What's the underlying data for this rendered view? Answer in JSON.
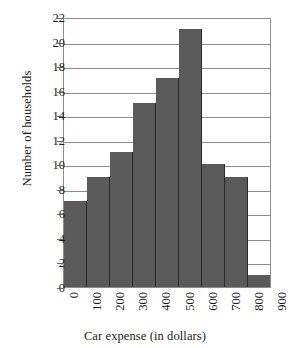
{
  "chart_data": {
    "type": "bar",
    "title": "",
    "subtitle": "",
    "xlabel": "Car expense (in dollars)",
    "ylabel": "Number of households",
    "categories": [
      "0-100",
      "100-200",
      "200-300",
      "300-400",
      "400-500",
      "500-600",
      "600-700",
      "700-800",
      "800-900"
    ],
    "bin_edges": [
      0,
      100,
      200,
      300,
      400,
      500,
      600,
      700,
      800,
      900
    ],
    "values": [
      7,
      9,
      11,
      15,
      17,
      21,
      10,
      9,
      1
    ],
    "xlim": [
      0,
      900
    ],
    "ylim": [
      0,
      22
    ],
    "y_ticks": [
      0,
      2,
      4,
      6,
      8,
      10,
      12,
      14,
      16,
      18,
      20,
      22
    ],
    "x_ticks": [
      0,
      100,
      200,
      300,
      400,
      500,
      600,
      700,
      800,
      900
    ],
    "x_tick_labels": [
      "0",
      "100",
      "200",
      "300",
      "400",
      "500",
      "600",
      "700",
      "800",
      "900"
    ],
    "y_tick_labels": [
      "0",
      "2",
      "4",
      "6",
      "8",
      "10",
      "12",
      "14",
      "16",
      "18",
      "20",
      "22"
    ],
    "grid": "horizontal",
    "legend": null,
    "colors": {
      "bar_fill": "#5a5a5a",
      "bar_edge": "#2a2a2a",
      "axis": "#8d8d8d",
      "gridline": "#8d8d8d",
      "background": "#ffffff",
      "text": "#1a1a1a"
    }
  }
}
